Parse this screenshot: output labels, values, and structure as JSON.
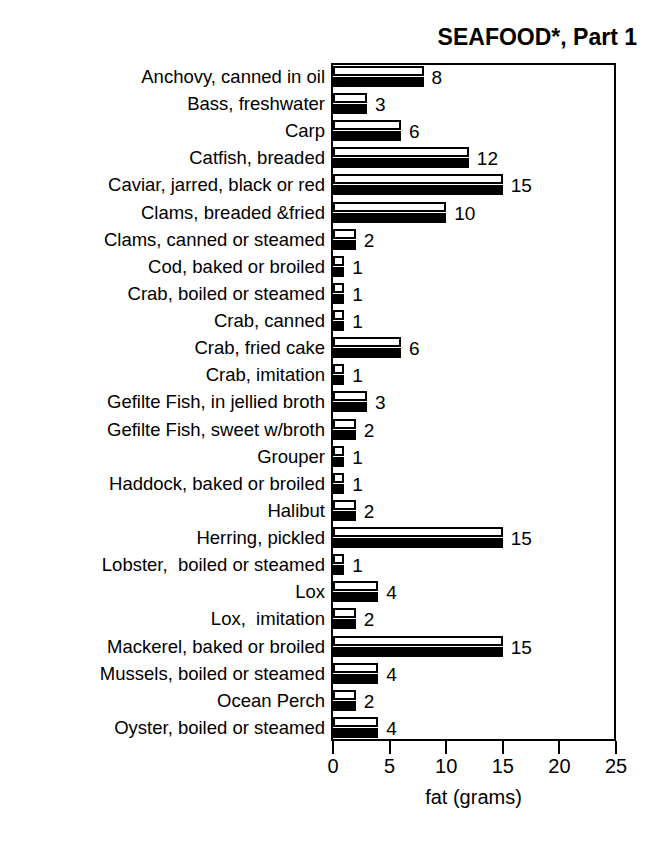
{
  "chart_data": {
    "type": "bar",
    "title": "SEAFOOD*, Part 1",
    "xlabel": "fat (grams)",
    "ylabel": "",
    "xlim": [
      0,
      25
    ],
    "xticks": [
      0,
      5,
      10,
      15,
      20,
      25
    ],
    "xtick_labels": [
      "0",
      "5",
      "10",
      "15",
      "20",
      "25"
    ],
    "grid": false,
    "legend": false,
    "orientation": "horizontal",
    "bar_style": "paired white-outline over black-fill, equal lengths",
    "categories": [
      "Anchovy, canned in oil",
      "Bass, freshwater",
      "Carp",
      "Catfish, breaded",
      "Caviar, jarred, black or red",
      "Clams, breaded &fried",
      "Clams, canned or steamed",
      "Cod, baked or broiled",
      "Crab, boiled or steamed",
      "Crab, canned",
      "Crab, fried cake",
      "Crab, imitation",
      "Gefilte Fish, in jellied broth",
      "Gefilte Fish, sweet w/broth",
      "Grouper",
      "Haddock, baked or broiled",
      "Halibut",
      "Herring, pickled",
      "Lobster,  boiled or steamed",
      "Lox",
      "Lox,  imitation",
      "Mackerel, baked or broiled",
      "Mussels, boiled or steamed",
      "Ocean Perch",
      "Oyster, boiled or steamed"
    ],
    "values": [
      8,
      3,
      6,
      12,
      15,
      10,
      2,
      1,
      1,
      1,
      6,
      1,
      3,
      2,
      1,
      1,
      2,
      15,
      1,
      4,
      2,
      15,
      4,
      2,
      4
    ],
    "value_labels": [
      "8",
      "3",
      "6",
      "12",
      "15",
      "10",
      "2",
      "1",
      "1",
      "1",
      "6",
      "1",
      "3",
      "2",
      "1",
      "1",
      "2",
      "15",
      "1",
      "4",
      "2",
      "15",
      "4",
      "2",
      "4"
    ],
    "colors": {
      "bar_outline": "#000000",
      "bar_fill_top": "#ffffff",
      "bar_fill_bottom": "#000000",
      "axis": "#000000",
      "text": "#000000",
      "background": "#ffffff"
    }
  }
}
